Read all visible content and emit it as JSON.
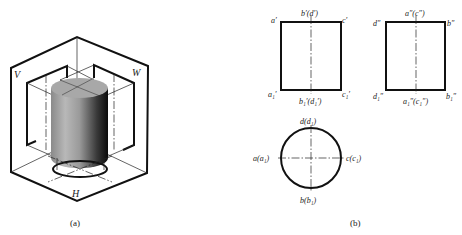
{
  "figure_a": {
    "caption": "(a)",
    "plane_labels": {
      "V": "V",
      "W": "W",
      "H": "H"
    },
    "object": "cylinder"
  },
  "figure_b": {
    "caption": "(b)",
    "front_view": {
      "labels": {
        "top_left": "a′",
        "top_center": "b′(d′)",
        "top_right": "c′",
        "bottom_left": "a₁′",
        "bottom_center": "b₁′(d₁′)",
        "bottom_right": "c₁′"
      }
    },
    "side_view": {
      "labels": {
        "top_left": "d″",
        "top_center": "a″(c″)",
        "top_right": "b″",
        "bottom_left": "d₁″",
        "bottom_center": "a₁″(c₁″)",
        "bottom_right": "b₁″"
      }
    },
    "top_view": {
      "labels": {
        "top": "d(d₁)",
        "left": "a(a₁)",
        "right": "c(c₁)",
        "bottom": "b(b₁)"
      }
    }
  }
}
